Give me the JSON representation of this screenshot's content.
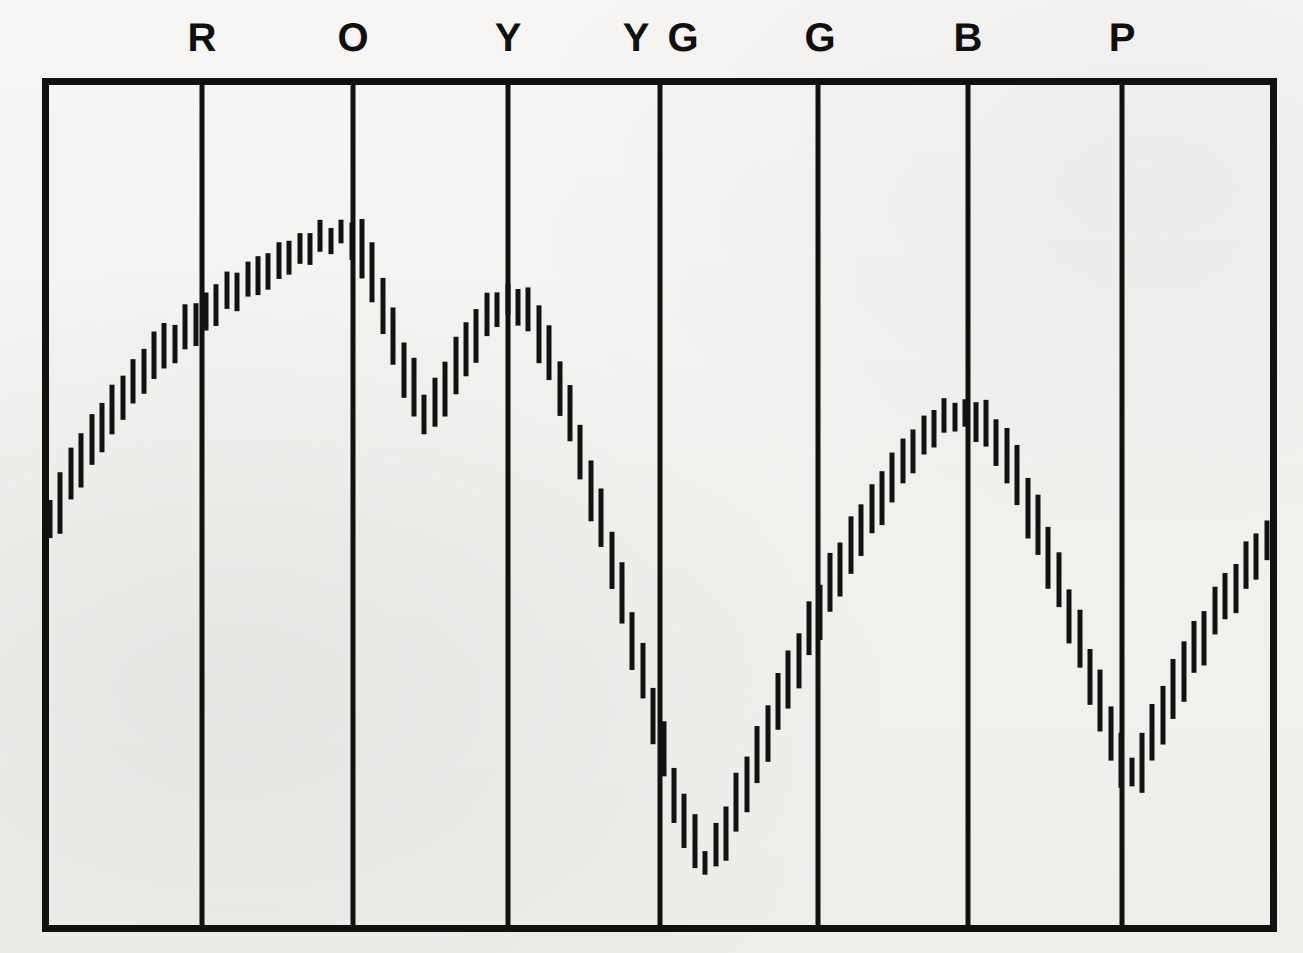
{
  "figure": {
    "kind": "chart-recorder-trace",
    "background_color": "#f3f2f0",
    "ink_color": "#111111",
    "width": 1303,
    "height": 953
  },
  "frame": {
    "left": 42,
    "right": 1277,
    "top": 78,
    "bottom": 932,
    "border_width": 7,
    "divider_width": 5,
    "divider_color": "#111111",
    "border_color": "#111111"
  },
  "band_labels": [
    {
      "text": "R",
      "x": 202
    },
    {
      "text": "O",
      "x": 353
    },
    {
      "text": "Y",
      "x": 508
    },
    {
      "text": "Y",
      "x": 636
    },
    {
      "text": "G",
      "x": 683
    },
    {
      "text": "G",
      "x": 820
    },
    {
      "text": "B",
      "x": 968
    },
    {
      "text": "P",
      "x": 1122
    }
  ],
  "dividers": [
    202,
    353,
    508,
    660,
    818,
    968,
    1122
  ],
  "trace": {
    "style": "vertical-tick-strokes",
    "stroke_color": "#121212",
    "stroke_width": 5,
    "tick_spacing": 10.4,
    "tick_length_min": 26,
    "tick_length_max": 58,
    "x_start": 50,
    "x_end": 1271
  },
  "chart_data": {
    "type": "line",
    "title": "",
    "subtitle": "",
    "xlabel": "",
    "ylabel": "",
    "grid": false,
    "legend": null,
    "categories": [
      "R",
      "O",
      "Y",
      "YG",
      "G",
      "B",
      "P"
    ],
    "category_boundaries_px": [
      42,
      202,
      353,
      508,
      660,
      818,
      968,
      1122,
      1277
    ],
    "axis": {
      "x_px_range": [
        42,
        1277
      ],
      "y_px_range": [
        78,
        932
      ],
      "y_value_range": [
        0,
        100
      ],
      "x_value_label": "wavelength (colour band)",
      "y_value_label": "relative reflectance"
    },
    "x": [
      50,
      60,
      71,
      81,
      92,
      102,
      112,
      123,
      133,
      144,
      154,
      164,
      175,
      185,
      196,
      206,
      216,
      227,
      237,
      248,
      258,
      268,
      279,
      289,
      300,
      310,
      320,
      331,
      341,
      352,
      362,
      372,
      383,
      393,
      404,
      414,
      424,
      435,
      445,
      456,
      466,
      476,
      487,
      497,
      508,
      518,
      528,
      539,
      549,
      560,
      570,
      580,
      591,
      601,
      612,
      622,
      632,
      643,
      653,
      664,
      674,
      684,
      695,
      705,
      716,
      726,
      736,
      747,
      757,
      768,
      778,
      788,
      799,
      809,
      820,
      830,
      840,
      851,
      861,
      872,
      882,
      892,
      903,
      913,
      924,
      934,
      944,
      955,
      965,
      976,
      986,
      996,
      1007,
      1017,
      1028,
      1038,
      1048,
      1059,
      1069,
      1080,
      1090,
      1100,
      1111,
      1121,
      1132,
      1142,
      1152,
      1163,
      1173,
      1184,
      1194,
      1204,
      1215,
      1225,
      1236,
      1246,
      1256,
      1267
    ],
    "y": [
      48.0,
      50.5,
      52.8,
      55.0,
      57.0,
      58.9,
      60.6,
      62.3,
      63.8,
      65.3,
      66.6,
      67.9,
      69.1,
      70.2,
      71.3,
      72.3,
      73.2,
      74.1,
      75.0,
      75.8,
      76.6,
      77.4,
      78.1,
      78.8,
      79.4,
      80.0,
      80.5,
      80.9,
      81.2,
      81.0,
      79.4,
      76.6,
      73.2,
      69.4,
      65.9,
      62.8,
      60.6,
      61.4,
      63.5,
      65.8,
      67.9,
      69.9,
      71.5,
      72.6,
      73.2,
      73.0,
      72.0,
      70.0,
      67.2,
      63.8,
      60.0,
      56.0,
      51.8,
      47.5,
      43.2,
      38.8,
      34.3,
      29.8,
      25.2,
      20.6,
      16.0,
      12.2,
      9.6,
      8.4,
      9.3,
      11.6,
      14.4,
      17.4,
      20.4,
      23.4,
      26.4,
      29.3,
      32.1,
      34.8,
      37.4,
      39.9,
      42.3,
      44.6,
      46.8,
      48.9,
      50.9,
      52.8,
      54.6,
      56.2,
      57.6,
      58.7,
      59.5,
      60.0,
      60.1,
      59.7,
      58.6,
      57.0,
      55.0,
      52.6,
      49.9,
      47.0,
      43.9,
      40.6,
      37.2,
      33.6,
      30.0,
      26.4,
      23.0,
      20.0,
      18.0,
      19.6,
      22.6,
      25.4,
      28.0,
      30.4,
      32.6,
      34.7,
      36.7,
      38.6,
      40.4,
      42.1,
      43.7,
      45.2,
      46.6,
      47.9,
      49.0,
      49.8
    ]
  }
}
